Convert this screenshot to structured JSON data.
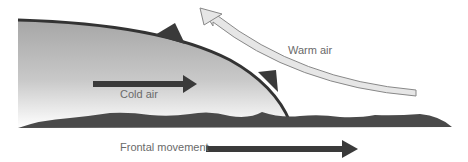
{
  "diagram": {
    "type": "cold-front-cross-section",
    "labels": {
      "cold_air": "Cold air",
      "warm_air": "Warm air",
      "frontal_movement": "Frontal movement"
    },
    "colors": {
      "front_line": "#333333",
      "arrow_dark": "#3a3a3a",
      "ground": "#4a4a4a",
      "cold_air_top": "#a8a8a8",
      "cold_air_bottom": "#ffffff",
      "warm_arrow_fill": "#e6e6e6",
      "warm_arrow_stroke": "#888888",
      "text": "#6a6a6a"
    }
  }
}
